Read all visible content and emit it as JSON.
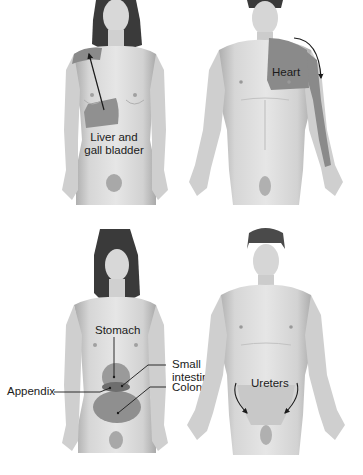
{
  "colors": {
    "background": "#ffffff",
    "skin": "#dcdcdc",
    "skin_shade": "#b9b9b9",
    "skin_dark": "#8f8f8f",
    "hair": "#3a3a3a",
    "referred_pain_area": "#8a8a8a",
    "organ_dark": "#707070",
    "label_text": "#1a1a1a",
    "arrow": "#1a1a1a"
  },
  "panels": [
    {
      "id": "top-left",
      "figure": "female-front",
      "labels": [
        {
          "text_lines": [
            "Liver and",
            "gall bladder"
          ]
        }
      ],
      "highlight_regions": [
        "right-shoulder",
        "right-upper-abdomen"
      ]
    },
    {
      "id": "top-right",
      "figure": "male-front",
      "labels": [
        {
          "text_lines": [
            "Heart"
          ]
        }
      ],
      "highlight_regions": [
        "left-chest",
        "left-arm"
      ]
    },
    {
      "id": "bottom-left",
      "figure": "female-front",
      "labels": [
        {
          "text_lines": [
            "Stomach"
          ]
        },
        {
          "text_lines": [
            "Small",
            "intestine"
          ]
        },
        {
          "text_lines": [
            "Colon"
          ]
        },
        {
          "text_lines": [
            "Appendix"
          ]
        }
      ],
      "highlight_regions": [
        "epigastric",
        "periumbilical",
        "lower-abdomen"
      ]
    },
    {
      "id": "bottom-right",
      "figure": "male-front",
      "labels": [
        {
          "text_lines": [
            "Ureters"
          ]
        }
      ],
      "highlight_regions": [
        "flanks-to-groin"
      ]
    }
  ],
  "labels": {
    "liver_1": "Liver and",
    "liver_2": "gall bladder",
    "heart": "Heart",
    "stomach": "Stomach",
    "small_intestine_1": "Small",
    "small_intestine_2": "intestine",
    "colon": "Colon",
    "appendix": "Appendix",
    "ureters": "Ureters"
  }
}
